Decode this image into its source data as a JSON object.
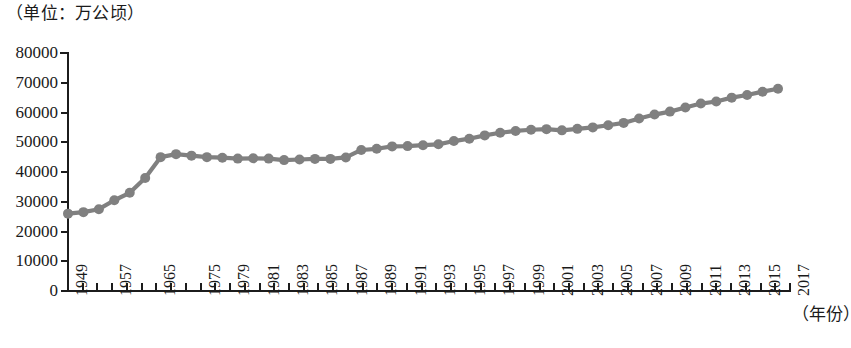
{
  "caption": {
    "unit_label": "（单位：万公顷）"
  },
  "axis": {
    "x_title": "（年份）",
    "y_ticks": [
      "80000",
      "70000",
      "60000",
      "50000",
      "40000",
      "30000",
      "20000",
      "10000",
      "0"
    ],
    "x_tick_labels": [
      "1949",
      "",
      "",
      "1957",
      "",
      "",
      "1965",
      "",
      "",
      "1975",
      "",
      "1979",
      "",
      "1981",
      "",
      "1983",
      "",
      "1985",
      "",
      "1987",
      "",
      "1989",
      "",
      "1991",
      "",
      "1993",
      "",
      "1995",
      "",
      "1997",
      "",
      "1999",
      "",
      "2001",
      "",
      "2003",
      "",
      "2005",
      "",
      "2007",
      "",
      "2009",
      "",
      "2011",
      "",
      "2013",
      "",
      "2015",
      "",
      "2017"
    ]
  },
  "style": {
    "series_color": "#808080",
    "axis_color": "#1c1c1c",
    "text_color": "#1a1a1a",
    "background": "#ffffff"
  },
  "chart_data": {
    "type": "line",
    "title": "",
    "subtitle": "",
    "xlabel": "（年份）",
    "ylabel": "（单位：万公顷）",
    "ylim": [
      0,
      80000
    ],
    "xlim": [
      1949,
      2017
    ],
    "grid": false,
    "legend": false,
    "marker": "circle",
    "series": [
      {
        "name": "有效灌溉面积",
        "x": [
          1949,
          1952,
          1957,
          1962,
          1965,
          1970,
          1975,
          1978,
          1979,
          1980,
          1981,
          1982,
          1983,
          1984,
          1985,
          1986,
          1987,
          1988,
          1989,
          1990,
          1991,
          1992,
          1993,
          1994,
          1995,
          1996,
          1997,
          1998,
          1999,
          2000,
          2001,
          2002,
          2003,
          2004,
          2005,
          2006,
          2007,
          2008,
          2009,
          2010,
          2011,
          2012,
          2013,
          2014,
          2015,
          2016,
          2017
        ],
        "values": [
          26000,
          26500,
          27500,
          30500,
          33000,
          38000,
          45000,
          46000,
          45500,
          45000,
          44800,
          44500,
          44600,
          44500,
          44000,
          44200,
          44400,
          44400,
          44900,
          47400,
          47800,
          48600,
          48700,
          49000,
          49300,
          50400,
          51200,
          52300,
          53200,
          53800,
          54200,
          54400,
          54000,
          54500,
          55000,
          55700,
          56500,
          58000,
          59300,
          60300,
          61700,
          63000,
          63700,
          65000,
          65900,
          67000,
          68000
        ]
      }
    ]
  }
}
